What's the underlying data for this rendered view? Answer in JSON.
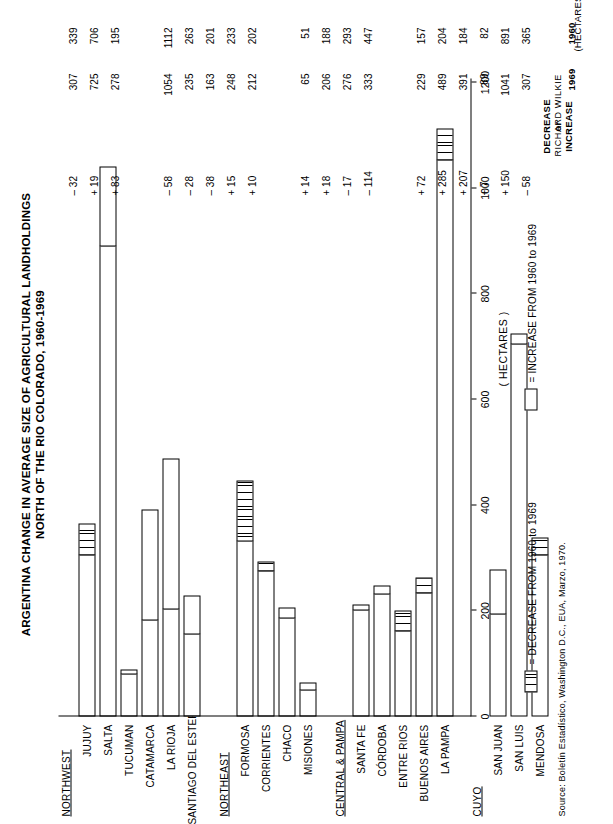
{
  "title_line1": "ARGENTINA CHANGE IN AVERAGE SIZE OF AGRICULTURAL LANDHOLDINGS",
  "title_line2": "NORTH OF THE RIO COLORADO, 1960-1969",
  "axis_title": "( HECTARES )",
  "units_note": "(HECTARES)",
  "column_headers": {
    "c1960": "1960",
    "c1969": "1969",
    "change_line1": "DECREASE",
    "change_line2": "or",
    "change_line3": "INCREASE"
  },
  "legend": [
    {
      "key": "decrease",
      "label": "= DECREASE FROM 1960 to 1969"
    },
    {
      "key": "increase",
      "label": "= INCREASE FROM 1960 to 1969"
    }
  ],
  "source": "Source: Boletín Estadístico, Washington D.C., EUA, Marzo, 1970.",
  "credit": "RICHARD WILKIE",
  "chart_data": {
    "type": "bar",
    "xlabel": "( HECTARES )",
    "ylabel": "",
    "xlim": [
      0,
      1200
    ],
    "ticks": [
      0,
      200,
      400,
      600,
      800,
      1000,
      1200
    ],
    "grid": false,
    "legend_position": "bottom",
    "groups": [
      {
        "name": "NORTHWEST",
        "rows": [
          {
            "label": "JUJUY",
            "v1960": 365,
            "v1969": 307,
            "change": "–  58",
            "dir": "dec"
          },
          {
            "label": "SALTA",
            "v1960": 891,
            "v1969": 1041,
            "change": "+ 150",
            "dir": "inc"
          },
          {
            "label": "TUCUMAN",
            "v1960": 82,
            "v1969": 89,
            "change": "+    7",
            "dir": "inc"
          },
          {
            "label": "CATAMARCA",
            "v1960": 184,
            "v1969": 391,
            "change": "+ 207",
            "dir": "inc"
          },
          {
            "label": "LA RIOJA",
            "v1960": 204,
            "v1969": 489,
            "change": "+ 285",
            "dir": "inc"
          },
          {
            "label": "SANTIAGO DEL ESTERO",
            "v1960": 157,
            "v1969": 229,
            "change": "+  72",
            "dir": "inc"
          }
        ]
      },
      {
        "name": "NORTHEAST",
        "rows": [
          {
            "label": "FORMOSA",
            "v1960": 447,
            "v1969": 333,
            "change": "– 114",
            "dir": "dec"
          },
          {
            "label": "CORRIENTES",
            "v1960": 293,
            "v1969": 276,
            "change": "–  17",
            "dir": "dec"
          },
          {
            "label": "CHACO",
            "v1960": 188,
            "v1969": 206,
            "change": "+  18",
            "dir": "inc"
          },
          {
            "label": "MISIONES",
            "v1960": 51,
            "v1969": 65,
            "change": "+  14",
            "dir": "inc"
          }
        ]
      },
      {
        "name": "CENTRAL & PAMPA",
        "rows": [
          {
            "label": "SANTA FE",
            "v1960": 202,
            "v1969": 212,
            "change": "+  10",
            "dir": "inc"
          },
          {
            "label": "CÓRDOBA",
            "v1960": 233,
            "v1969": 248,
            "change": "+  15",
            "dir": "inc"
          },
          {
            "label": "ENTRE RIOS",
            "v1960": 201,
            "v1969": 163,
            "change": "–  38",
            "dir": "dec"
          },
          {
            "label": "BUENOS AIRES",
            "v1960": 263,
            "v1969": 235,
            "change": "–  28",
            "dir": "dec"
          },
          {
            "label": "LA PAMPA",
            "v1960": 1112,
            "v1969": 1054,
            "change": "–  58",
            "dir": "dec"
          }
        ]
      },
      {
        "name": "CUYO",
        "rows": [
          {
            "label": "SAN JUAN",
            "v1960": 195,
            "v1969": 278,
            "change": "+  83",
            "dir": "inc"
          },
          {
            "label": "SAN LUIS",
            "v1960": 706,
            "v1969": 725,
            "change": "+  19",
            "dir": "inc"
          },
          {
            "label": "MENDOSA",
            "v1960": 339,
            "v1969": 307,
            "change": "–  32",
            "dir": "dec"
          }
        ]
      }
    ]
  }
}
